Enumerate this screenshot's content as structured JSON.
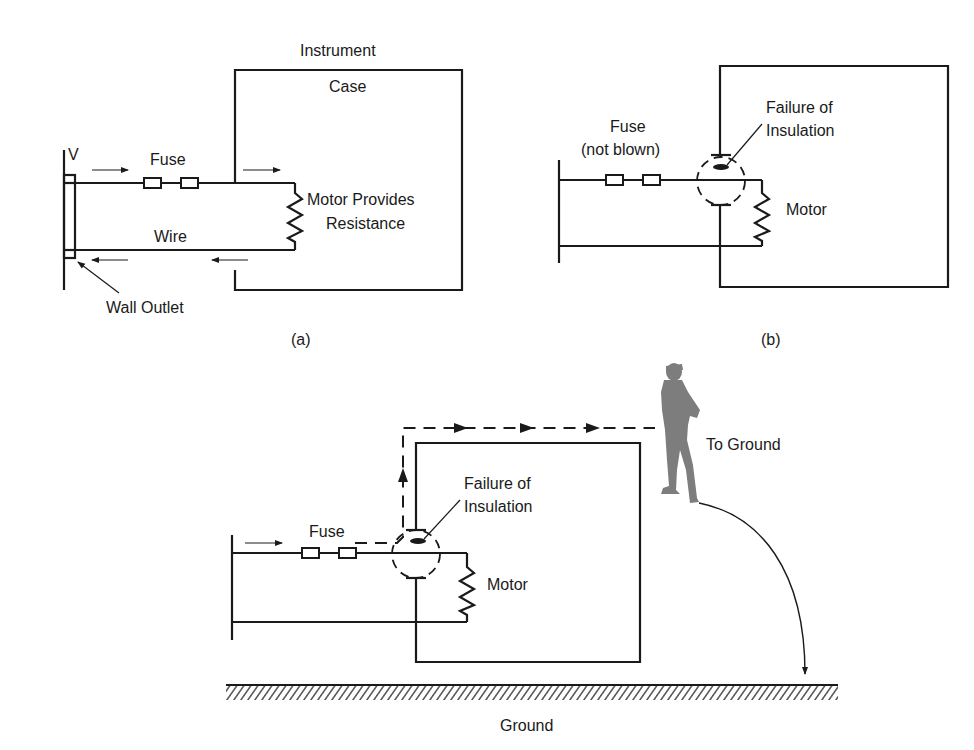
{
  "figure": {
    "panel_a": {
      "caption": "(a)",
      "labels": {
        "instrument": "Instrument",
        "case": "Case",
        "voltage": "V",
        "fuse": "Fuse",
        "motor_line1": "Motor Provides",
        "motor_line2": "Resistance",
        "wire": "Wire",
        "wall_outlet": "Wall Outlet"
      }
    },
    "panel_b": {
      "caption": "(b)",
      "labels": {
        "fuse_line1": "Fuse",
        "fuse_line2": "(not blown)",
        "failure_line1": "Failure of",
        "failure_line2": "Insulation",
        "motor": "Motor"
      }
    },
    "panel_c": {
      "labels": {
        "fuse": "Fuse",
        "failure_line1": "Failure of",
        "failure_line2": "Insulation",
        "motor": "Motor",
        "to_ground": "To Ground",
        "ground": "Ground"
      }
    },
    "colors": {
      "line": "#1a1a1a",
      "person": "#7a7a7a",
      "background": "#ffffff"
    }
  }
}
